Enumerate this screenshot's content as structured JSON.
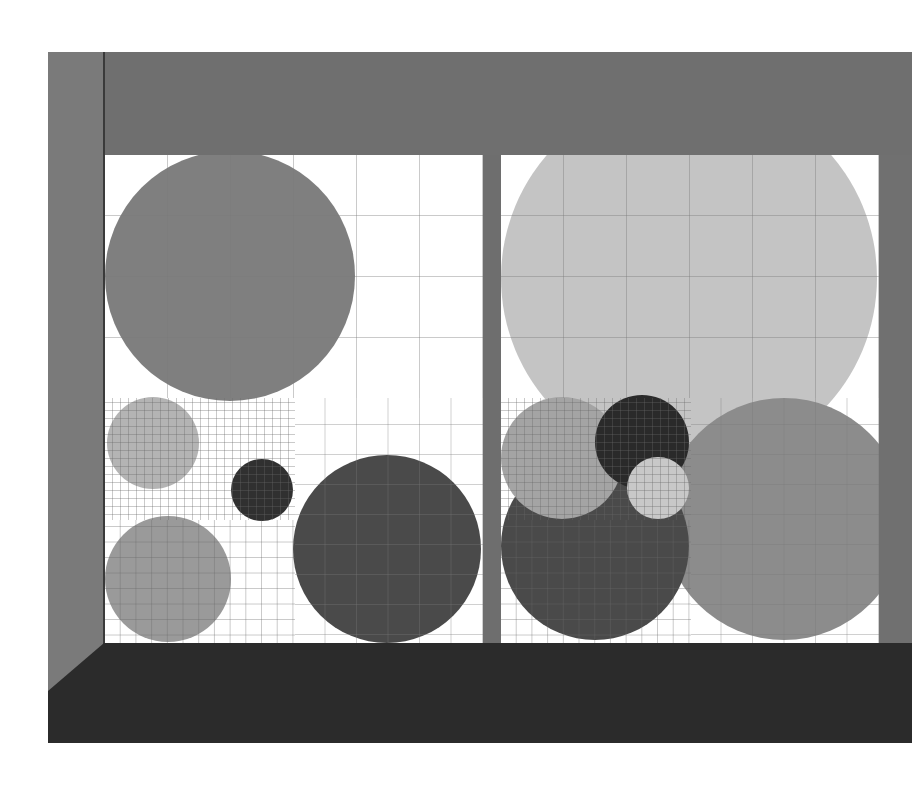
{
  "scene": {
    "title": "Gridded circle panels in room frame",
    "colors": {
      "wall": "#7a7a7a",
      "top_band": "#6f6f6f",
      "floor": "#2b2b2b",
      "pillar": "#6e6e6e",
      "panel_bg": "#ffffff",
      "grid_line": "#555555"
    }
  },
  "panels": [
    {
      "name": "left-panel",
      "circles": [
        {
          "cx": 125,
          "cy": 121,
          "r": 125,
          "fill": "#7f7f7f"
        },
        {
          "cx": 48,
          "cy": 288,
          "r": 46,
          "fill": "#b4b4b4"
        },
        {
          "cx": 157,
          "cy": 335,
          "r": 31,
          "fill": "#303030"
        },
        {
          "cx": 63,
          "cy": 424,
          "r": 63,
          "fill": "#9a9a9a"
        },
        {
          "cx": 282,
          "cy": 394,
          "r": 94,
          "fill": "#4a4a4a"
        }
      ]
    },
    {
      "name": "right-panel",
      "circles": [
        {
          "cx": 188,
          "cy": 123,
          "r": 188,
          "fill": "#c4c4c4"
        },
        {
          "cx": 283,
          "cy": 364,
          "r": 121,
          "fill": "#8c8c8c"
        },
        {
          "cx": 94,
          "cy": 391,
          "r": 94,
          "fill": "#4a4a4a"
        },
        {
          "cx": 61,
          "cy": 303,
          "r": 61,
          "fill": "#a4a4a4"
        },
        {
          "cx": 141,
          "cy": 287,
          "r": 47,
          "fill": "#2a2a2a"
        },
        {
          "cx": 157,
          "cy": 333,
          "r": 31,
          "fill": "#c8c8c8"
        }
      ]
    }
  ]
}
